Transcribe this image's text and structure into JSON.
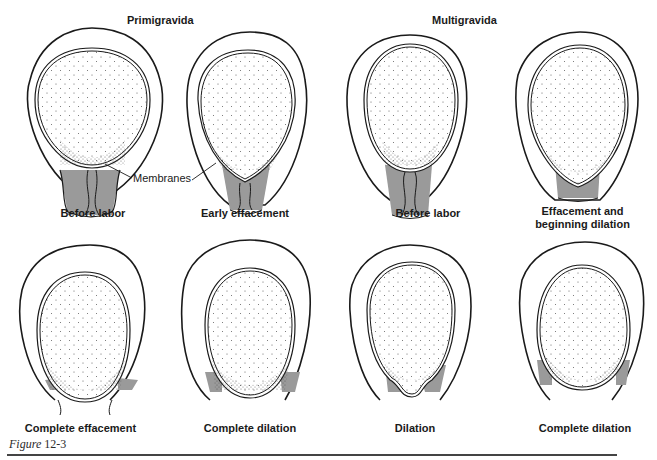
{
  "groups": {
    "left": "Primigravida",
    "right": "Multigravida"
  },
  "callout": "Membranes",
  "panels": [
    {
      "label": "Before labor",
      "group": "Primigravida",
      "row": 1
    },
    {
      "label": "Early effacement",
      "group": "Primigravida",
      "row": 1
    },
    {
      "label": "Before labor",
      "group": "Multigravida",
      "row": 1
    },
    {
      "label_line1": "Effacement and",
      "label_line2": "beginning dilation",
      "group": "Multigravida",
      "row": 1
    },
    {
      "label": "Complete effacement",
      "group": "Primigravida",
      "row": 2
    },
    {
      "label": "Complete dilation",
      "group": "Primigravida",
      "row": 2
    },
    {
      "label": "Dilation",
      "group": "Multigravida",
      "row": 2
    },
    {
      "label": "Complete dilation",
      "group": "Multigravida",
      "row": 2
    }
  ],
  "caption": {
    "word": "Figure",
    "number": "12-3"
  },
  "colors": {
    "line": "#1a1a1a",
    "cervix_fill": "#9a9a9a",
    "stipple": "#555555",
    "background": "#ffffff"
  }
}
